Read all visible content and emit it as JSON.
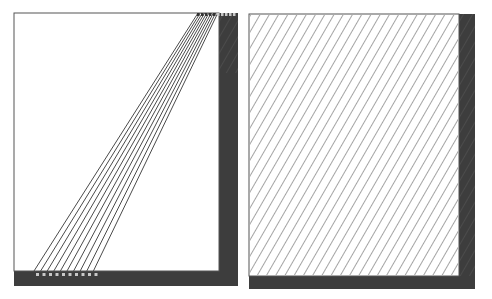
{
  "diagram": {
    "panels": [
      {
        "id": "left",
        "description": "Partial diagonal hatching band with dark right and bottom borders",
        "frame": {
          "x": 14,
          "y": 13,
          "w": 205,
          "h": 258
        },
        "dark_right": {
          "x": 219,
          "y": 13,
          "w": 19,
          "h": 273
        },
        "dark_bottom": {
          "x": 14,
          "y": 271,
          "w": 224,
          "h": 15
        },
        "line_count": 10,
        "lines_bottom_x_start": 34,
        "lines_top_x_start": 198,
        "line_spacing": 6.6,
        "bottom_dots": 10,
        "top_dots": 10
      },
      {
        "id": "right",
        "description": "Full diagonal hatching with dark right and bottom borders",
        "frame": {
          "x": 249,
          "y": 14,
          "w": 210,
          "h": 263
        },
        "dark_right": {
          "x": 459,
          "y": 14,
          "w": 16,
          "h": 275
        },
        "dark_bottom": {
          "x": 249,
          "y": 276,
          "w": 226,
          "h": 13
        },
        "hatch_spacing": 8
      }
    ],
    "colors": {
      "frame_dark": "#3d3d3d",
      "line": "#4a4a4a",
      "fill": "#ffffff",
      "dot": "#c8c8c8"
    }
  }
}
